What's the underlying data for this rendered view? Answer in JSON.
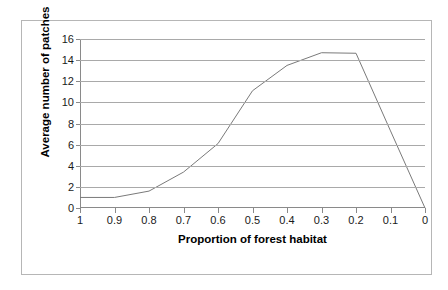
{
  "chart_data": {
    "type": "line",
    "title": "",
    "xlabel": "Proportion of forest habitat",
    "ylabel": "Average number of patches",
    "x_tick_labels": [
      "1",
      "0.9",
      "0.8",
      "0.7",
      "0.6",
      "0.5",
      "0.4",
      "0.3",
      "0.2",
      "0.1",
      "0"
    ],
    "y_tick_labels": [
      "0",
      "2",
      "4",
      "6",
      "8",
      "10",
      "12",
      "14",
      "16"
    ],
    "x": [
      1,
      0.9,
      0.8,
      0.7,
      0.6,
      0.5,
      0.4,
      0.3,
      0.2,
      0.1,
      0
    ],
    "values": [
      1.0,
      1.0,
      1.6,
      3.4,
      6.1,
      11.1,
      13.5,
      14.7,
      14.65,
      7.3,
      0.0
    ],
    "xlim": [
      1,
      0
    ],
    "ylim": [
      0,
      16
    ],
    "y_tick_step": 2,
    "x_axis_direction": "descending",
    "grid": "horizontal",
    "legend": "none",
    "series_color": "#7a7a7a",
    "gridline_color": "#a9a9a9",
    "axis_color": "#8a8a8a",
    "frame_color": "#b6b6b6",
    "background": "#ffffff",
    "text_color": "#1a1a1a"
  }
}
